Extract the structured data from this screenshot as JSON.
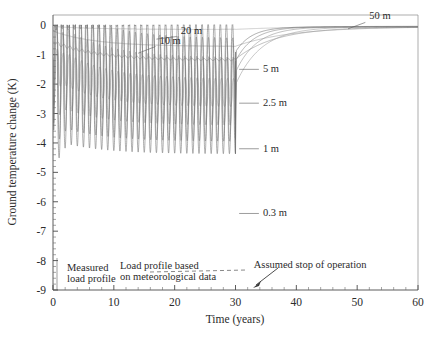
{
  "chart_data": {
    "type": "line",
    "title": "",
    "xlabel": "Time (years)",
    "ylabel": "Ground temperature change (K)",
    "xlim": [
      0,
      60
    ],
    "ylim": [
      -9,
      0.35
    ],
    "xticks": [
      0,
      10,
      20,
      30,
      40,
      50,
      60
    ],
    "xtick_labels": [
      "0",
      "10",
      "20",
      "30",
      "40",
      "50",
      "60"
    ],
    "yticks": [
      0,
      -1,
      -2,
      -3,
      -4,
      -5,
      -6,
      -7,
      -8,
      -9
    ],
    "ytick_labels": [
      "0",
      "-1",
      "-2",
      "-3",
      "-4",
      "-5",
      "-6",
      "-7",
      "-8",
      "-9"
    ],
    "grid": false,
    "legend_position": "inline-labels",
    "operation_stop_year": 30,
    "measured_profile_end_year": 2,
    "series": [
      {
        "name": "0.3 m",
        "label": "0.3 m",
        "label_x": 34.5,
        "label_y": -6.5,
        "color": "#6b6b6b",
        "mean_start": -1.1,
        "mean_end": -2.15,
        "amp_start": 5.6,
        "amp_end": 4.45,
        "phase": 0.0,
        "recovery_tau": 2.6,
        "recovery_end": -0.05
      },
      {
        "name": "1 m",
        "label": "1 m",
        "label_x": 34.5,
        "label_y": -4.3,
        "color": "#7a7a7a",
        "mean_start": -1.15,
        "mean_end": -2.2,
        "amp_start": 4.4,
        "amp_end": 3.5,
        "phase": 0.05,
        "recovery_tau": 2.9,
        "recovery_end": -0.05
      },
      {
        "name": "2.5 m",
        "label": "2.5 m",
        "label_x": 34.5,
        "label_y": -2.75,
        "color": "#8a8a8a",
        "mean_start": -1.2,
        "mean_end": -2.25,
        "amp_start": 2.9,
        "amp_end": 2.3,
        "phase": 0.12,
        "recovery_tau": 3.4,
        "recovery_end": -0.05
      },
      {
        "name": "5 m",
        "label": "5 m",
        "label_x": 34.5,
        "label_y": -1.6,
        "color": "#979797",
        "mean_start": -1.2,
        "mean_end": -2.3,
        "amp_start": 1.2,
        "amp_end": 0.95,
        "phase": 0.2,
        "recovery_tau": 4.2,
        "recovery_end": -0.05
      },
      {
        "name": "10 m",
        "label": "10 m",
        "label_x": 17.5,
        "label_y": -0.62,
        "color": "#a2a2a2",
        "mean_start": -0.55,
        "mean_end": -1.18,
        "amp_start": 0.12,
        "amp_end": 0.07,
        "phase": 0.3,
        "recovery_tau": 6.5,
        "recovery_end": -0.06
      },
      {
        "name": "20 m",
        "label": "20 m",
        "label_x": 21.0,
        "label_y": -0.28,
        "color": "#b0b0b0",
        "mean_start": -0.2,
        "mean_end": -0.72,
        "amp_start": 0.0,
        "amp_end": 0.0,
        "phase": 0.0,
        "recovery_tau": 9.0,
        "recovery_end": -0.05
      },
      {
        "name": "50 m",
        "label": "50 m",
        "label_x": 52.0,
        "label_y": 0.2,
        "color": "#bbbbbb",
        "mean_start": -0.04,
        "mean_end": -0.14,
        "amp_start": 0.0,
        "amp_end": 0.0,
        "phase": 0.0,
        "recovery_tau": 12.0,
        "recovery_end": -0.02
      }
    ],
    "annotations": [
      {
        "id": "measured-load-profile",
        "text_line1": "Measured",
        "text_line2": "load profile",
        "x": 2.3,
        "y": -8.35
      },
      {
        "id": "modeled-load-profile",
        "text_line1": "Load profile based",
        "text_line2": "on meteorological data",
        "x": 11.0,
        "y": -8.3
      },
      {
        "id": "assumed-stop-of-operation",
        "text_line1": "Assumed stop of operation",
        "text_line2": "",
        "x": 33.0,
        "y": -8.25
      }
    ]
  }
}
